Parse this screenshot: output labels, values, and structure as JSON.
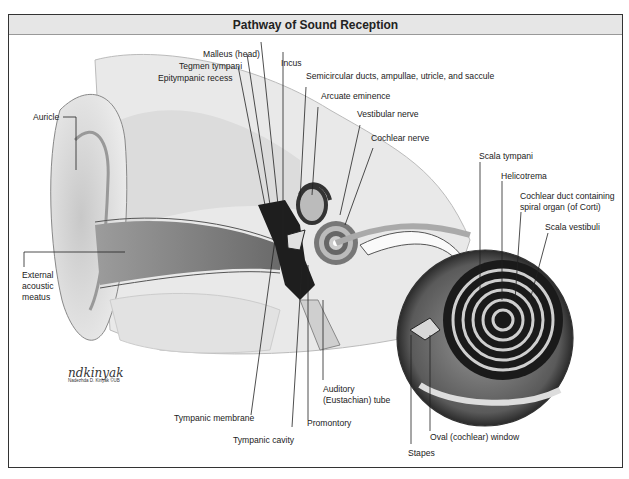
{
  "figure": {
    "title": "Pathway of Sound Reception",
    "signature": "ndkinyak",
    "signature_sub": "Nadezhda D. Kiriyak ©UB"
  },
  "labels": {
    "malleus": "Malleus (head)",
    "tegmen": "Tegmen tympani",
    "epitympanic": "Epitympanic recess",
    "incus": "Incus",
    "semicircular": "Semicircular ducts, ampullae, utricle, and saccule",
    "arcuate": "Arcuate eminence",
    "vestibular_nerve": "Vestibular nerve",
    "cochlear_nerve": "Cochlear nerve",
    "auricle": "Auricle",
    "external_line1": "External",
    "external_line2": "acoustic",
    "external_line3": "meatus",
    "scala_tympani": "Scala tympani",
    "helicotrema": "Helicotrema",
    "cochlear_duct_line1": "Cochlear duct containing",
    "cochlear_duct_line2": "spiral organ (of Corti)",
    "scala_vestibuli": "Scala vestibuli",
    "tympanic_membrane": "Tympanic membrane",
    "tympanic_cavity": "Tympanic cavity",
    "promontory": "Promontory",
    "auditory_line1": "Auditory",
    "auditory_line2": "(Eustachian) tube",
    "oval_window": "Oval (cochlear) window",
    "stapes": "Stapes"
  },
  "colors": {
    "frame": "#333333",
    "title_bg": "#e6e6e6",
    "illustration": "grayscale"
  }
}
